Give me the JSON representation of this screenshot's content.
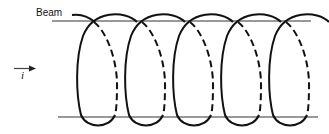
{
  "figure": {
    "type": "helix-trajectory-diagram",
    "labels": {
      "beam": "Beam",
      "direction": "i"
    },
    "colors": {
      "ink": "#111111",
      "background": "#ffffff"
    },
    "beam_lines": [
      {
        "name": "top-beam-line",
        "x1": 52,
        "y1": 21,
        "x2": 311,
        "y2": 21
      },
      {
        "name": "bottom-beam-line",
        "x1": 58,
        "y1": 117,
        "x2": 318,
        "y2": 117
      }
    ],
    "arrow": {
      "x1": 14,
      "y1": 69,
      "x2": 36,
      "y2": 69
    },
    "helix": {
      "turns": 5,
      "loop_left_edges": [
        79,
        127,
        175,
        223,
        271
      ],
      "loop_width": 50,
      "top_y": 14,
      "bottom_y": 125,
      "front_style": "solid",
      "back_style": "dashed"
    }
  }
}
